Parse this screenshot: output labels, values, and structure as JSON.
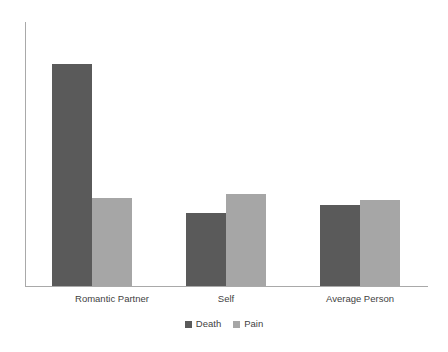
{
  "chart_data": {
    "type": "bar",
    "title": "",
    "subtitle": "",
    "xlabel": "",
    "ylabel": "",
    "categories": [
      "Romantic Partner",
      "Self",
      "Average Person"
    ],
    "series": [
      {
        "name": "Death",
        "color": "#5a5a5a",
        "values": [
          222,
          73,
          81
        ]
      },
      {
        "name": "Pain",
        "color": "#a6a6a6",
        "values": [
          88,
          92,
          86
        ]
      }
    ],
    "ylim": [
      0,
      265
    ],
    "grid": false,
    "legend_position": "bottom",
    "axis_color": "#a9a9a9",
    "text_color": "#3f3f3f",
    "background": "#ffffff",
    "bar_pixel_geometry": [
      {
        "category": "Romantic Partner",
        "death": {
          "x": 52,
          "top": 64,
          "width": 40,
          "height": 222
        },
        "pain": {
          "x": 92,
          "top": 198,
          "width": 40,
          "height": 88
        }
      },
      {
        "category": "Self",
        "death": {
          "x": 186,
          "top": 213,
          "width": 40,
          "height": 73
        },
        "pain": {
          "x": 226,
          "top": 194,
          "width": 40,
          "height": 92
        }
      },
      {
        "category": "Average Person",
        "death": {
          "x": 320,
          "top": 205,
          "width": 40,
          "height": 81
        },
        "pain": {
          "x": 360,
          "top": 200,
          "width": 40,
          "height": 86
        }
      }
    ],
    "category_label_centers": [
      112,
      226,
      360
    ]
  },
  "legend": {
    "items": [
      {
        "label": "Death",
        "swatch": "death-swatch"
      },
      {
        "label": "Pain",
        "swatch": "pain-swatch"
      }
    ]
  }
}
